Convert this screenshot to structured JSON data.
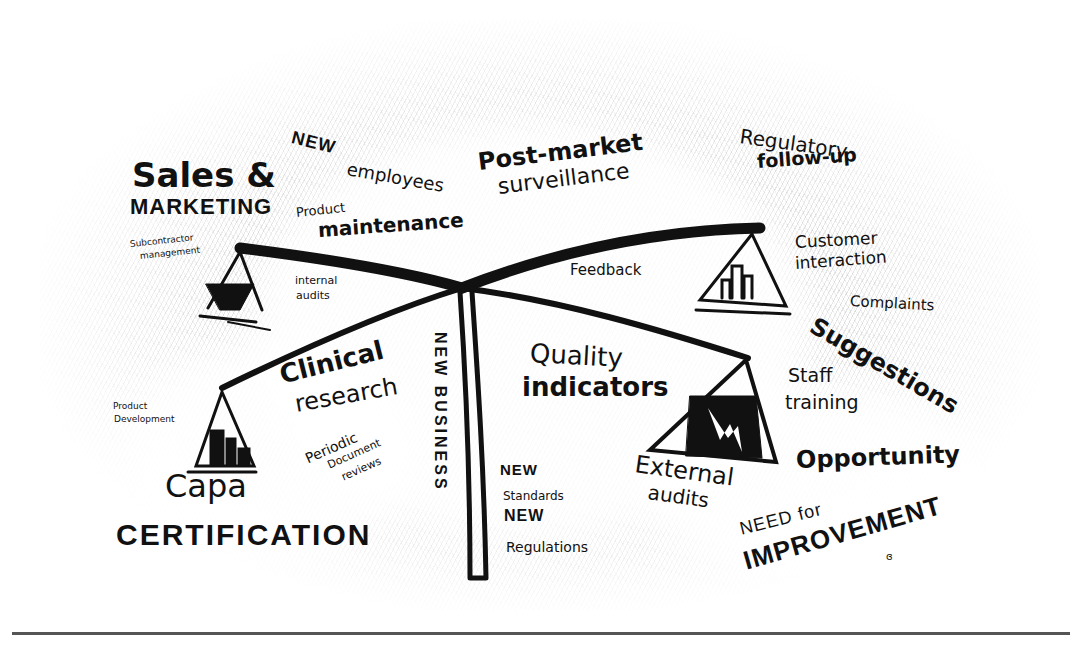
{
  "diagram": {
    "type": "balance-scale sketch",
    "scale": {
      "left_upper_pan_content": "bucket",
      "right_upper_pan_content": "bar-chart",
      "left_lower_pan_content": "stacked boxes",
      "right_lower_pan_content": "lightning chart"
    }
  },
  "labels": {
    "sales_marketing_line1": "Sales &",
    "sales_marketing_line2": "MARKETING",
    "subcontractor_line1": "Subcontractor",
    "subcontractor_line2": "management",
    "new_employees_new": "NEW",
    "new_employees_rest": "employees",
    "product_maintenance_line1": "Product",
    "product_maintenance_line2": "maintenance",
    "post_market_line1": "Post-market",
    "post_market_line2": "surveillance",
    "regulatory_line1": "Regulatory",
    "regulatory_line2": "follow-up",
    "customer_line1": "Customer",
    "customer_line2": "interaction",
    "internal_audits_line1": "internal",
    "internal_audits_line2": "audits",
    "feedback": "Feedback",
    "complaints": "Complaints",
    "suggestions": "Suggestions",
    "new_business": "NEW BUSINESS",
    "quality_line1": "Quality",
    "quality_line2": "indicators",
    "clinical_line1": "Clinical",
    "clinical_line2": "research",
    "product_development_line1": "Product",
    "product_development_line2": "Development",
    "staff_training_line1": "Staff",
    "staff_training_line2": "training",
    "periodic_line1": "Periodic",
    "periodic_line2": "Document",
    "periodic_line3": "reviews",
    "new_standards_new1": "NEW",
    "new_standards_standards": "Standards",
    "new_standards_new2": "NEW",
    "new_standards_regulations": "Regulations",
    "external_audits_line1": "External",
    "external_audits_line2": "audits",
    "opportunity": "Opportunity",
    "capa": "Capa",
    "certification": "CERTIFICATION",
    "need_for": "NEED for",
    "improvement": "IMPROVEMENT",
    "signature": "ɞ"
  },
  "colors": {
    "ink": "#111111",
    "paper": "#ffffff",
    "shading": "#9a9a9a"
  }
}
